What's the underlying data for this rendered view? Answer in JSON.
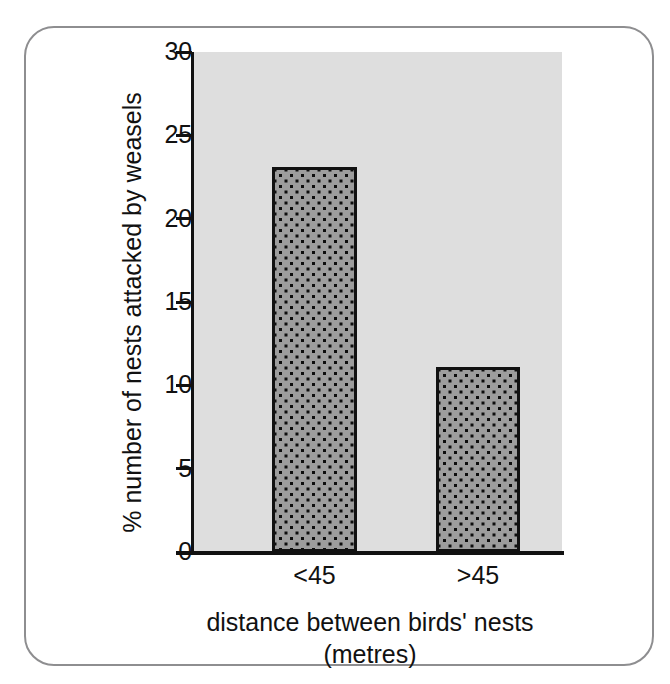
{
  "figure": {
    "frame_color": "#8e8e90",
    "background": "#ffffff"
  },
  "chart_data": {
    "type": "bar",
    "title": "",
    "subtitle": "",
    "categories": [
      "<45",
      ">45"
    ],
    "values": [
      23.1,
      11.1
    ],
    "xlabel": "distance between birds' nests",
    "xlabel_line2": "(metres)",
    "ylabel": "% number of nests attacked by weasels",
    "ylim": [
      0,
      30
    ],
    "yticks": [
      0,
      5,
      10,
      15,
      20,
      25,
      30
    ],
    "ytick_labels": [
      "0",
      "5",
      "10",
      "15",
      "20",
      "25",
      "30"
    ],
    "xtick_labels": [
      "<45",
      ">45"
    ],
    "grid": false,
    "legend": null,
    "legend_position": "none",
    "bar_fill_color": "#9d9d9d",
    "bar_edge_color": "#111111",
    "bar_hatch": "dotted",
    "plot_background": "#dedede",
    "axis_color": "#111111",
    "series": [
      {
        "name": "% nests attacked by weasels",
        "values": [
          23.1,
          11.1
        ]
      }
    ]
  }
}
